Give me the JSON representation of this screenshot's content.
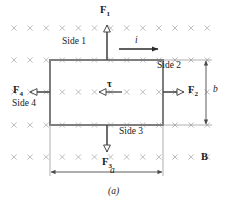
{
  "figure": {
    "caption": "(a)",
    "field_symbol_glyph": "×",
    "field_grid": {
      "columns": 13,
      "rows": 5,
      "x_start": 14,
      "x_step": 16.1,
      "y_rows": [
        28,
        60,
        92,
        125,
        157
      ],
      "color": "#b0b0b0"
    },
    "loop": {
      "x": 50,
      "y": 60,
      "width": 113,
      "height": 65,
      "stroke": "#7a7a7a",
      "stroke_width": 2
    },
    "colors": {
      "line": "#3a3a3a",
      "loop": "#7a7a7a",
      "field": "#b0b0b0",
      "text": "#1a1a1a"
    }
  },
  "labels": {
    "force_top": {
      "symbol": "F",
      "subscript": "1",
      "x": 100,
      "y": 6
    },
    "force_right": {
      "symbol": "F",
      "subscript": "2",
      "x": 188,
      "y": 86
    },
    "force_bottom": {
      "symbol": "F",
      "subscript": "3",
      "x": 102,
      "y": 158
    },
    "force_left": {
      "symbol": "F",
      "subscript": "4",
      "x": 13,
      "y": 86
    },
    "field_label": {
      "symbol": "B",
      "x": 201,
      "y": 152
    },
    "torque_label": {
      "symbol": "τ",
      "x": 107,
      "y": 80
    },
    "current_label": {
      "symbol": "i",
      "x": 135,
      "y": 36
    },
    "side_1": {
      "text": "Side 1",
      "x": 62,
      "y": 37
    },
    "side_2": {
      "text": "Side 2",
      "x": 157,
      "y": 61
    },
    "side_3": {
      "text": "Side 3",
      "x": 119,
      "y": 127
    },
    "side_4": {
      "text": "Side 4",
      "x": 12,
      "y": 99
    },
    "dim_a": {
      "text": "a",
      "x": 110,
      "y": 169
    },
    "dim_b": {
      "text": "b",
      "x": 212,
      "y": 86
    },
    "caption": {
      "text": "(a)",
      "x": 109,
      "y": 187
    }
  },
  "arrows": {
    "force_top": {
      "from": [
        107,
        60
      ],
      "to": [
        107,
        22
      ],
      "head": "hollow",
      "label": "F1"
    },
    "force_right": {
      "from": [
        163,
        92
      ],
      "to": [
        186,
        92
      ],
      "head": "hollow",
      "label": "F2"
    },
    "force_bottom": {
      "from": [
        107,
        125
      ],
      "to": [
        107,
        155
      ],
      "head": "hollow",
      "label": "F3"
    },
    "force_left": {
      "from": [
        50,
        92
      ],
      "to": [
        28,
        92
      ],
      "head": "hollow",
      "label": "F4"
    },
    "torque": {
      "from": [
        122,
        92
      ],
      "to": [
        96,
        92
      ],
      "head": "hollow",
      "label": "tau"
    },
    "current": {
      "from": [
        119,
        49
      ],
      "to": [
        160,
        49
      ],
      "head": "solid",
      "label": "i"
    },
    "dim_a": {
      "from": [
        50,
        172
      ],
      "to": [
        163,
        172
      ],
      "head": "double",
      "label": "a"
    },
    "dim_b": {
      "from": [
        206,
        60
      ],
      "to": [
        206,
        125
      ],
      "head": "double",
      "label": "b"
    }
  }
}
